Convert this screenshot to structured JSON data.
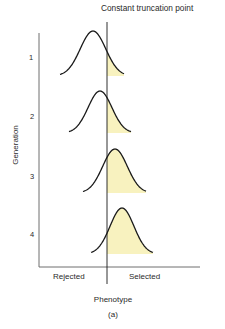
{
  "figure": {
    "title": "Constant truncation point",
    "y_axis_label": "Generation",
    "x_axis_label": "Phenotype",
    "caption": "(a)",
    "region_left": "Rejected",
    "region_right": "Selected",
    "generations": [
      "1",
      "2",
      "3",
      "4"
    ],
    "colors": {
      "line": "#1a1a1a",
      "axis": "#6f6f6f",
      "fill": "#f8f2bf",
      "text": "#2a2a2a"
    }
  },
  "curves": [
    {
      "generation": "1",
      "peak_x": 93,
      "peak_y": 31,
      "base_y": 76,
      "x_start": 60,
      "x_end": 124
    },
    {
      "generation": "2",
      "peak_x": 100,
      "peak_y": 91,
      "base_y": 133,
      "x_start": 69,
      "x_end": 131
    },
    {
      "generation": "3",
      "peak_x": 115,
      "peak_y": 149,
      "base_y": 193,
      "x_start": 83,
      "x_end": 146
    },
    {
      "generation": "4",
      "peak_x": 122,
      "peak_y": 208,
      "base_y": 254,
      "x_start": 91,
      "x_end": 153
    }
  ]
}
